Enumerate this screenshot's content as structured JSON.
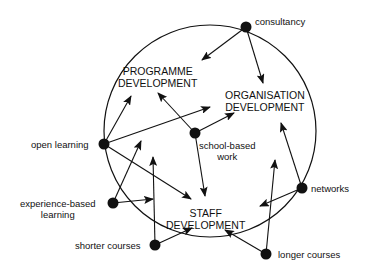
{
  "diagram": {
    "circle": {
      "cx": 210,
      "cy": 131,
      "r": 106
    },
    "outcomes": [
      {
        "id": "programme",
        "line1": "PROGRAMME",
        "line2": "DEVELOPMENT"
      },
      {
        "id": "organisation",
        "line1": "ORGANISATION",
        "line2": "DEVELOPMENT"
      },
      {
        "id": "staff",
        "line1": "STAFF",
        "line2": "DEVELOPMENT"
      }
    ],
    "nodes": [
      {
        "id": "consultancy",
        "label": "consultancy",
        "x": 246,
        "y": 27
      },
      {
        "id": "school-based-work",
        "label_line1": "school-based",
        "label_line2": "work",
        "x": 195,
        "y": 133
      },
      {
        "id": "open-learning",
        "label": "open learning",
        "x": 104,
        "y": 144
      },
      {
        "id": "experience-based-learning",
        "label_line1": "experience-based",
        "label_line2": "learning",
        "x": 113,
        "y": 203
      },
      {
        "id": "shorter-courses",
        "label": "shorter courses",
        "x": 155,
        "y": 245
      },
      {
        "id": "networks",
        "label": "networks",
        "x": 302,
        "y": 188
      },
      {
        "id": "longer-courses",
        "label": "longer courses",
        "x": 266,
        "y": 254
      }
    ],
    "arrows": [
      {
        "from": "consultancy",
        "x1": 246,
        "y1": 27,
        "x2": 202,
        "y2": 60
      },
      {
        "from": "consultancy",
        "x1": 246,
        "y1": 27,
        "x2": 263,
        "y2": 83
      },
      {
        "from": "open-learning",
        "x1": 104,
        "y1": 144,
        "x2": 131,
        "y2": 96
      },
      {
        "from": "open-learning",
        "x1": 104,
        "y1": 144,
        "x2": 210,
        "y2": 107
      },
      {
        "from": "open-learning",
        "x1": 104,
        "y1": 144,
        "x2": 191,
        "y2": 199
      },
      {
        "from": "school-based-work",
        "x1": 195,
        "y1": 133,
        "x2": 158,
        "y2": 93
      },
      {
        "from": "school-based-work",
        "x1": 195,
        "y1": 133,
        "x2": 234,
        "y2": 113
      },
      {
        "from": "school-based-work",
        "x1": 195,
        "y1": 133,
        "x2": 205,
        "y2": 196
      },
      {
        "from": "experience-based-learning",
        "x1": 113,
        "y1": 203,
        "x2": 141,
        "y2": 141
      },
      {
        "from": "experience-based-learning",
        "x1": 113,
        "y1": 203,
        "x2": 153,
        "y2": 199
      },
      {
        "from": "shorter-courses",
        "x1": 155,
        "y1": 245,
        "x2": 153,
        "y2": 157
      },
      {
        "from": "shorter-courses",
        "x1": 155,
        "y1": 245,
        "x2": 192,
        "y2": 228
      },
      {
        "from": "networks",
        "x1": 302,
        "y1": 188,
        "x2": 281,
        "y2": 123
      },
      {
        "from": "networks",
        "x1": 302,
        "y1": 188,
        "x2": 260,
        "y2": 206
      },
      {
        "from": "longer-courses",
        "x1": 266,
        "y1": 254,
        "x2": 275,
        "y2": 160
      },
      {
        "from": "longer-courses",
        "x1": 266,
        "y1": 254,
        "x2": 225,
        "y2": 230
      }
    ]
  }
}
